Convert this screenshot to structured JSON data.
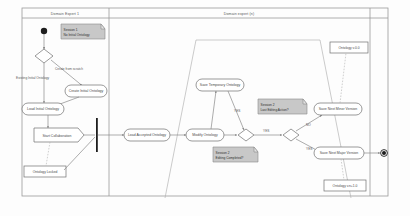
{
  "diagram": {
    "kind": "uml-activity-diagram",
    "width": 410,
    "height": 216,
    "background": "#fdfdfd",
    "line_color": "#8a8a8a",
    "note_fill": "#c8c8c8",
    "node_fill": "#ffffff"
  },
  "partitions": [
    {
      "id": "left",
      "title": "Domain Expert 1"
    },
    {
      "id": "right",
      "title": "Domain expert (n)"
    }
  ],
  "nodes": {
    "initial": {
      "label": ""
    },
    "decision_start": {
      "label": ""
    },
    "create_initial_ontology": {
      "label": "Create Initial Ontology"
    },
    "load_initial_ontology": {
      "label": "Load Initial Ontology"
    },
    "start_collaboration": {
      "label": "Start Collaboration"
    },
    "ontology_v0": {
      "label": "Ontology v.0.0"
    },
    "ontology_locked": {
      "label": "Ontology Locked"
    },
    "load_accepted_ontology": {
      "label": "Load Accepted Ontology"
    },
    "modify_ontology": {
      "label": "Modify Ontology"
    },
    "save_temporary_ontology": {
      "label": "Save Temporary Ontology"
    },
    "decision_editing_complete": {
      "label": ""
    },
    "decision_last_editing": {
      "label": ""
    },
    "save_next_minor_version": {
      "label": "Save Next Minor Version"
    },
    "save_next_major_version": {
      "label": "Save Next Major Version"
    },
    "ontology_vnn1": {
      "label": "Ontology v.n+1.0"
    },
    "final": {
      "label": ""
    }
  },
  "notes": [
    {
      "id": "note_session_1",
      "lines": [
        "Session 1",
        "No Initial Ontology"
      ]
    },
    {
      "id": "note_session_n_last",
      "lines": [
        "Session 2",
        "Last Editing Action?"
      ]
    },
    {
      "id": "note_session_editing",
      "lines": [
        "Session 2",
        "Editing Completed?"
      ]
    }
  ],
  "edge_labels": {
    "create_from_scratch": "Create from scratch",
    "existing_initial_ontology": "Existing Initial Ontology",
    "guard_yes_1": "YES",
    "guard_yes_2": "YES",
    "guard_no_1": "NO",
    "guard_no_2": "NO",
    "guard_yes_3": "YES"
  }
}
